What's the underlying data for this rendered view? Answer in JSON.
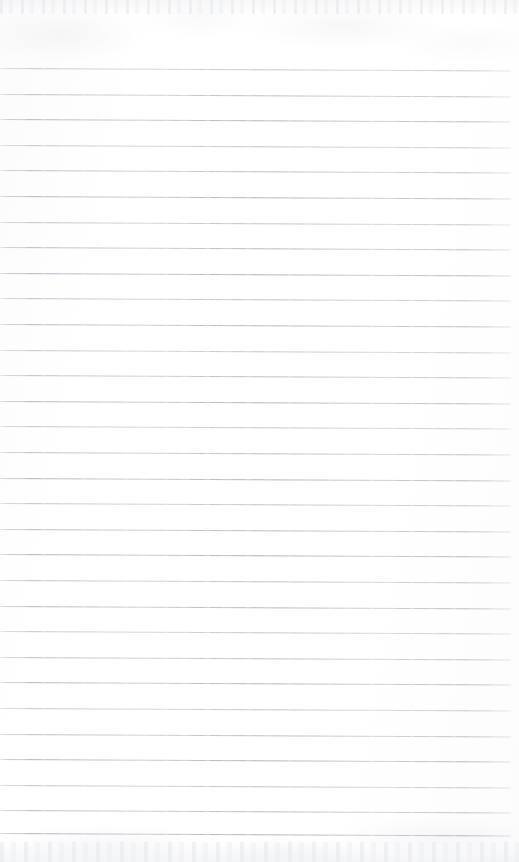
{
  "document": {
    "kind": "scanned-lined-paper",
    "title": "Scanned blank ruled notebook page",
    "text_content": "",
    "visible_text": [],
    "page_width_px": 519,
    "page_height_px": 862
  },
  "paper": {
    "background_color": "#fdfdfe",
    "surface_tint_color": "#fbfbfc",
    "has_margin_line": false,
    "has_holes": false,
    "has_handwriting": false
  },
  "ruling": {
    "line_color": "#aeb3bb",
    "line_thickness_px": 1,
    "line_spacing_px": 25.6,
    "first_line_y_px": 68,
    "last_line_y_px": 833,
    "line_start_x_px": 0,
    "line_end_x_px": 511,
    "line_count": 31,
    "skew_degrees": 0.28,
    "line_y_positions": [
      68,
      93.6,
      119.2,
      144.8,
      170.4,
      196,
      221.6,
      247.2,
      272.8,
      298.4,
      324,
      349.6,
      375.2,
      400.8,
      426.4,
      452,
      477.6,
      503.2,
      528.8,
      554.4,
      580,
      605.6,
      631.2,
      656.8,
      682.4,
      708,
      733.6,
      759.2,
      784.8,
      810.4,
      833
    ]
  },
  "scan_artifacts": {
    "top_noise_band": {
      "present": true,
      "height_px": 14,
      "color": "#dee1e6"
    },
    "bottom_noise_band": {
      "present": true,
      "height_px": 20,
      "color": "#e0e3e8"
    },
    "overall_noise_color": "#e8eaee"
  }
}
